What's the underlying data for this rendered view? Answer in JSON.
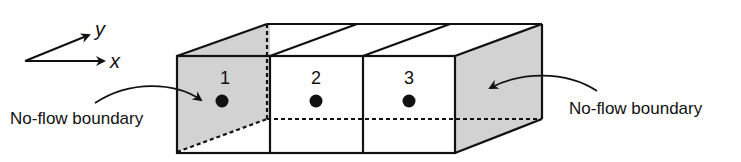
{
  "diagram": {
    "type": "three-cell groundwater model block",
    "axes": {
      "x_label": "x",
      "y_label": "y"
    },
    "cells": [
      {
        "label": "1"
      },
      {
        "label": "2"
      },
      {
        "label": "3"
      }
    ],
    "boundaries": {
      "left_label": "No-flow boundary",
      "right_label": "No-flow boundary"
    },
    "colors": {
      "boundary_fill": "#d2d2d2",
      "line": "#111111",
      "cell_fill": "#ffffff"
    }
  }
}
